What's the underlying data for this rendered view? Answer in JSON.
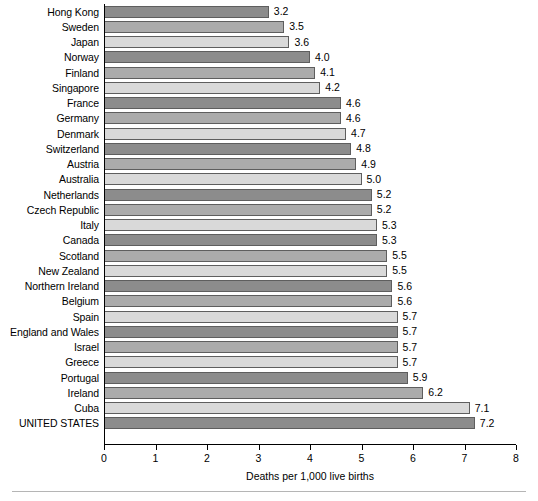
{
  "chart_data": {
    "type": "bar",
    "orientation": "horizontal",
    "title": "",
    "xlabel": "Deaths per 1,000 live births",
    "ylabel": "",
    "xlim": [
      0,
      8
    ],
    "xticks": [
      "0",
      "1",
      "2",
      "3",
      "4",
      "5",
      "6",
      "7",
      "8"
    ],
    "grid": false,
    "legend": null,
    "categories": [
      "Hong Kong",
      "Sweden",
      "Japan",
      "Norway",
      "Finland",
      "Singapore",
      "France",
      "Germany",
      "Denmark",
      "Switzerland",
      "Austria",
      "Australia",
      "Netherlands",
      "Czech Republic",
      "Italy",
      "Canada",
      "Scotland",
      "New Zealand",
      "Northern Ireland",
      "Belgium",
      "Spain",
      "England and Wales",
      "Israel",
      "Greece",
      "Portugal",
      "Ireland",
      "Cuba",
      "UNITED STATES"
    ],
    "values": [
      3.2,
      3.5,
      3.6,
      4.0,
      4.1,
      4.2,
      4.6,
      4.6,
      4.7,
      4.8,
      4.9,
      5.0,
      5.2,
      5.2,
      5.3,
      5.3,
      5.5,
      5.5,
      5.6,
      5.6,
      5.7,
      5.7,
      5.7,
      5.7,
      5.9,
      6.2,
      7.1,
      7.2
    ],
    "value_labels": [
      "3.2",
      "3.5",
      "3.6",
      "4.0",
      "4.1",
      "4.2",
      "4.6",
      "4.6",
      "4.7",
      "4.8",
      "4.9",
      "5.0",
      "5.2",
      "5.2",
      "5.3",
      "5.3",
      "5.5",
      "5.5",
      "5.6",
      "5.6",
      "5.7",
      "5.7",
      "5.7",
      "5.7",
      "5.9",
      "6.2",
      "7.1",
      "7.2"
    ],
    "bar_colors_cycle": [
      "#8c8c8c",
      "#ababab",
      "#d9d9d9"
    ],
    "bar_border_color": "#5e5e5e",
    "axis_color": "#000000"
  }
}
